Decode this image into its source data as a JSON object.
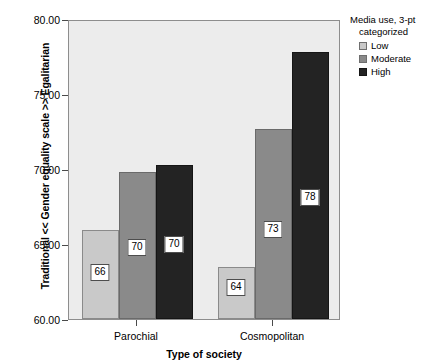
{
  "chart_data": {
    "type": "bar",
    "title": "",
    "xlabel": "Type of society",
    "ylabel": "Traditional << Gender equality scale >> Egalitarian",
    "categories": [
      "Parochial",
      "Cosmopolitan"
    ],
    "ylim": [
      60.0,
      80.0
    ],
    "yticks": [
      "60.00",
      "65.00",
      "70.00",
      "75.00",
      "80.00"
    ],
    "ytick_values": [
      60.0,
      65.0,
      70.0,
      75.0,
      80.0
    ],
    "grid": false,
    "legend_position": "right",
    "legend_title_line1": "Media use, 3-pt",
    "legend_title_line2": "categorized",
    "series": [
      {
        "name": "Low",
        "color": "#c9c9c9",
        "values": [
          65.95,
          63.5
        ],
        "labels": [
          "66",
          "64"
        ]
      },
      {
        "name": "Moderate",
        "color": "#8a8a8a",
        "values": [
          69.8,
          72.7
        ],
        "labels": [
          "70",
          "73"
        ]
      },
      {
        "name": "High",
        "color": "#232323",
        "values": [
          70.3,
          77.8
        ],
        "labels": [
          "70",
          "78"
        ]
      }
    ]
  },
  "plot": {
    "background": "#ececec",
    "frame_color": "#8d8d8d"
  }
}
